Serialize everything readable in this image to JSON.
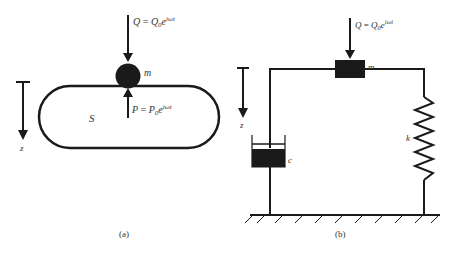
{
  "panel_a": {
    "caption": "(a)",
    "force_Q": {
      "lhs": "Q",
      "eq": " = ",
      "rhs_base": "Q",
      "rhs_sub": "0",
      "rhs_e": "e",
      "rhs_exp": "iωt"
    },
    "mass_label": "m",
    "force_P": {
      "lhs": "P",
      "eq": " = ",
      "rhs_base": "P",
      "rhs_sub": "0",
      "rhs_e": "e",
      "rhs_exp": "iωt"
    },
    "body_label": "S",
    "axis_label": "z"
  },
  "panel_b": {
    "caption": "(b)",
    "force_Q": {
      "lhs": "Q",
      "eq": " = ",
      "rhs_base": "Q",
      "rhs_sub": "0",
      "rhs_e": "e",
      "rhs_exp": "iωt"
    },
    "mass_label": "m",
    "damper_label": "c",
    "spring_label": "k",
    "axis_label": "z"
  },
  "colors": {
    "ink": "#1a1a1a",
    "text": "#333333",
    "background": "#ffffff"
  }
}
